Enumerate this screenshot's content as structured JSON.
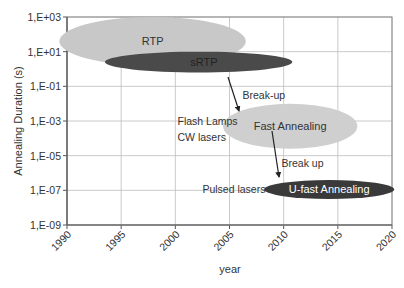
{
  "chart_data": {
    "type": "scatter",
    "title": "",
    "xlabel": "year",
    "ylabel": "Annealing Duration (s)",
    "xlim": [
      1990,
      2020
    ],
    "ylim_log10": [
      -9,
      3
    ],
    "y_scale": "log",
    "grid": true,
    "x_ticks": [
      "1990",
      "1995",
      "2000",
      "2005",
      "2010",
      "2015",
      "2020"
    ],
    "y_ticks": [
      "1,E+03",
      "1,E+01",
      "1,E-01",
      "1,E-03",
      "1,E-05",
      "1,E-07",
      "1,E-09"
    ],
    "regions": [
      {
        "name": "RTP",
        "x_range": [
          1989.3,
          2006.5
        ],
        "y_range_log10": [
          0.2,
          3.0
        ],
        "color": "#c8c8c8",
        "text_color": "#333333"
      },
      {
        "name": "sRTP",
        "x_range": [
          1993.5,
          2010.8
        ],
        "y_range_log10": [
          -0.2,
          1.0
        ],
        "color": "#4a4a4a",
        "text_color": "#222222"
      },
      {
        "name": "Fast Annealing",
        "x_range": [
          2004.4,
          2016.8
        ],
        "y_range_log10": [
          -4.6,
          -2.0
        ],
        "color": "#cfcfcf",
        "text_color": "#333333"
      },
      {
        "name": "U-fast Annealing",
        "x_range": [
          2008.2,
          2020.2
        ],
        "y_range_log10": [
          -7.5,
          -6.4
        ],
        "color": "#3a3a3a",
        "text_color": "#ffffff"
      }
    ],
    "annotations": [
      {
        "text": "Break-up",
        "x": 2006.2,
        "y_log10": -1.5
      },
      {
        "text": "Flash Lamps",
        "x": 2000.2,
        "y_log10": -3.0
      },
      {
        "text": "CW lasers",
        "x": 2000.2,
        "y_log10": -3.9
      },
      {
        "text": "Break up",
        "x": 2009.8,
        "y_log10": -5.4
      },
      {
        "text": "Pulsed lasers",
        "x": 2002.5,
        "y_log10": -6.9
      }
    ],
    "arrows": [
      {
        "from": "sRTP",
        "to": "Fast Annealing"
      },
      {
        "from": "Fast Annealing",
        "to": "U-fast Annealing"
      }
    ]
  }
}
